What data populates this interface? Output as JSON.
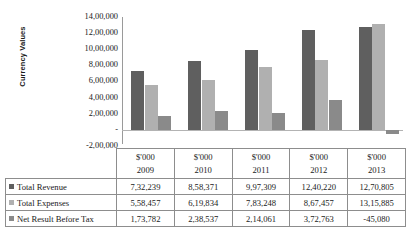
{
  "chart_data": {
    "type": "bar",
    "title": "",
    "xlabel": "",
    "ylabel": "Currency Values",
    "categories": [
      "2009",
      "2010",
      "2011",
      "2012",
      "2013"
    ],
    "category_unit": "$'000",
    "ylim": [
      -200000,
      1400000
    ],
    "ytick_labels": [
      "14,00,000",
      "12,00,000",
      "10,00,000",
      "8,00,000",
      "6,00,000",
      "4,00,000",
      "2,00,000",
      "-",
      "-2,00,000"
    ],
    "ytick_values": [
      1400000,
      1200000,
      1000000,
      800000,
      600000,
      400000,
      200000,
      0,
      -200000
    ],
    "grid": false,
    "legend_position": "table-left-column",
    "series": [
      {
        "name": "Total Revenue",
        "color": "#5f5f5f",
        "values": [
          732239,
          858371,
          997309,
          1240220,
          1270805
        ],
        "labels": [
          "7,32,239",
          "8,58,371",
          "9,97,309",
          "12,40,220",
          "12,70,805"
        ]
      },
      {
        "name": "Total Expenses",
        "color": "#b0b0b0",
        "values": [
          558457,
          619834,
          783248,
          867457,
          1315885
        ],
        "labels": [
          "5,58,457",
          "6,19,834",
          "7,83,248",
          "8,67,457",
          "13,15,885"
        ]
      },
      {
        "name": "Net Result Before Tax",
        "color": "#8a8a8a",
        "values": [
          173782,
          238537,
          214061,
          372763,
          -45080
        ],
        "labels": [
          "1,73,782",
          "2,38,537",
          "2,14,061",
          "3,72,763",
          "-45,080"
        ]
      }
    ]
  },
  "table": {
    "header_unit": "$'000",
    "columns": [
      "2009",
      "2010",
      "2011",
      "2012",
      "2013"
    ],
    "rows": [
      {
        "label": "Total Revenue",
        "swatch_color": "#5f5f5f",
        "values": [
          "7,32,239",
          "8,58,371",
          "9,97,309",
          "12,40,220",
          "12,70,805"
        ]
      },
      {
        "label": "Total Expenses",
        "swatch_color": "#b0b0b0",
        "values": [
          "5,58,457",
          "6,19,834",
          "7,83,248",
          "8,67,457",
          "13,15,885"
        ]
      },
      {
        "label": "Net Result Before Tax",
        "swatch_color": "#8a8a8a",
        "values": [
          "1,73,782",
          "2,38,537",
          "2,14,061",
          "3,72,763",
          "-45,080"
        ]
      }
    ]
  }
}
